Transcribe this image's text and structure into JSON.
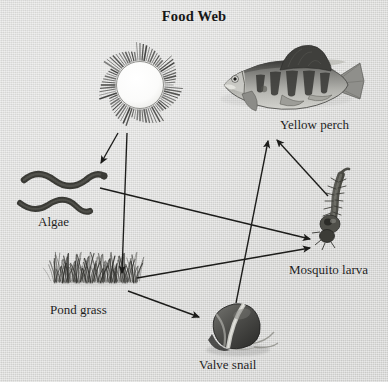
{
  "diagram": {
    "title": "Food Web",
    "type": "food-web",
    "background_color": "#d9d9d7",
    "ink_color": "#1a1a1a",
    "nodes": [
      {
        "id": "sun",
        "label": "Sun",
        "role": "energy-source",
        "label_position": "inside-circle",
        "x": 140,
        "y": 85
      },
      {
        "id": "algae",
        "label": "Algae",
        "role": "producer",
        "label_position": "below",
        "x": 60,
        "y": 190
      },
      {
        "id": "pond-grass",
        "label": "Pond grass",
        "role": "producer",
        "label_position": "below",
        "x": 95,
        "y": 290
      },
      {
        "id": "valve-snail",
        "label": "Valve snail",
        "role": "consumer",
        "label_position": "below",
        "x": 237,
        "y": 325
      },
      {
        "id": "mosquito-larva",
        "label": "Mosquito larva",
        "role": "consumer",
        "label_position": "below",
        "x": 333,
        "y": 225
      },
      {
        "id": "yellow-perch",
        "label": "Yellow perch",
        "role": "predator",
        "label_position": "below",
        "x": 290,
        "y": 85
      }
    ],
    "edges": [
      {
        "from": "sun",
        "to": "algae",
        "x1": 118,
        "y1": 133,
        "x2": 101,
        "y2": 163
      },
      {
        "from": "sun",
        "to": "pond-grass",
        "x1": 127,
        "y1": 133,
        "x2": 122,
        "y2": 273
      },
      {
        "from": "algae",
        "to": "mosquito-larva",
        "x1": 100,
        "y1": 188,
        "x2": 310,
        "y2": 239
      },
      {
        "from": "pond-grass",
        "to": "mosquito-larva",
        "x1": 137,
        "y1": 278,
        "x2": 310,
        "y2": 248
      },
      {
        "from": "pond-grass",
        "to": "valve-snail",
        "x1": 128,
        "y1": 291,
        "x2": 199,
        "y2": 317
      },
      {
        "from": "valve-snail",
        "to": "yellow-perch",
        "x1": 236,
        "y1": 303,
        "x2": 268,
        "y2": 141
      },
      {
        "from": "mosquito-larva",
        "to": "yellow-perch",
        "x1": 328,
        "y1": 196,
        "x2": 277,
        "y2": 140
      }
    ]
  }
}
